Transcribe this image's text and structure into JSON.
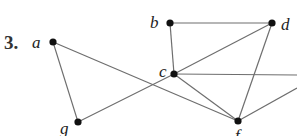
{
  "problem_number": "3.",
  "graph": {
    "vertices": [
      {
        "id": "a",
        "label": "a",
        "x": 53,
        "y": 42
      },
      {
        "id": "b",
        "label": "b",
        "x": 170,
        "y": 23
      },
      {
        "id": "d",
        "label": "d",
        "x": 272,
        "y": 23
      },
      {
        "id": "c",
        "label": "c",
        "x": 174,
        "y": 74
      },
      {
        "id": "f",
        "label": "f",
        "x": 238,
        "y": 121
      },
      {
        "id": "g",
        "label": "g",
        "x": 78,
        "y": 122
      }
    ],
    "edges": [
      [
        "a",
        "g"
      ],
      [
        "a",
        "f"
      ],
      [
        "g",
        "c"
      ],
      [
        "c",
        "d"
      ],
      [
        "b",
        "d"
      ],
      [
        "b",
        "c"
      ],
      [
        "c",
        "f"
      ],
      [
        "d",
        "f"
      ],
      [
        "c",
        "offright1"
      ],
      [
        "f",
        "offright2"
      ]
    ],
    "offscreen_points": {
      "offright1": {
        "x": 297,
        "y": 75
      },
      "offright2": {
        "x": 297,
        "y": 88
      }
    }
  }
}
